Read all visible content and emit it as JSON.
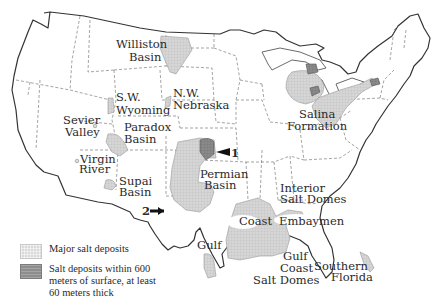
{
  "map": {
    "title": "",
    "colors": {
      "major_salt": "#d9d9d9",
      "shallow_salt": "#8e8e8e",
      "outline": "#333333",
      "background": "#ffffff"
    },
    "labels": {
      "williston": [
        "Williston",
        "Basin"
      ],
      "sw_wyoming": [
        "S.W.",
        "Wyoming"
      ],
      "nw_nebraska": [
        "N.W.",
        "Nebraska"
      ],
      "sevier": [
        "Sevier",
        "Valley"
      ],
      "paradox": [
        "Paradox",
        "Basin"
      ],
      "virgin": [
        "Virgin",
        "River"
      ],
      "supai": [
        "Supai",
        "Basin"
      ],
      "permian": [
        "Permian",
        "Basin"
      ],
      "salina": [
        "Salina",
        "Formation"
      ],
      "interior": [
        "Interior",
        "Salt Domes"
      ],
      "coast": "Coast",
      "embayment": "Embaymen",
      "gulf_left": "Gulf",
      "gulf_coast": [
        "Gulf",
        "Coast",
        "Salt Domes"
      ],
      "southern_florida": [
        "Southern",
        "Florida"
      ]
    },
    "markers": [
      {
        "id": "1",
        "label": "1"
      },
      {
        "id": "2",
        "label": "2"
      }
    ]
  },
  "legend": {
    "items": [
      {
        "swatch": "major",
        "label": "Major salt deposits"
      },
      {
        "swatch": "shallow",
        "label": "Salt deposits within 600 meters of surface, at least 60 meters thick"
      }
    ]
  }
}
